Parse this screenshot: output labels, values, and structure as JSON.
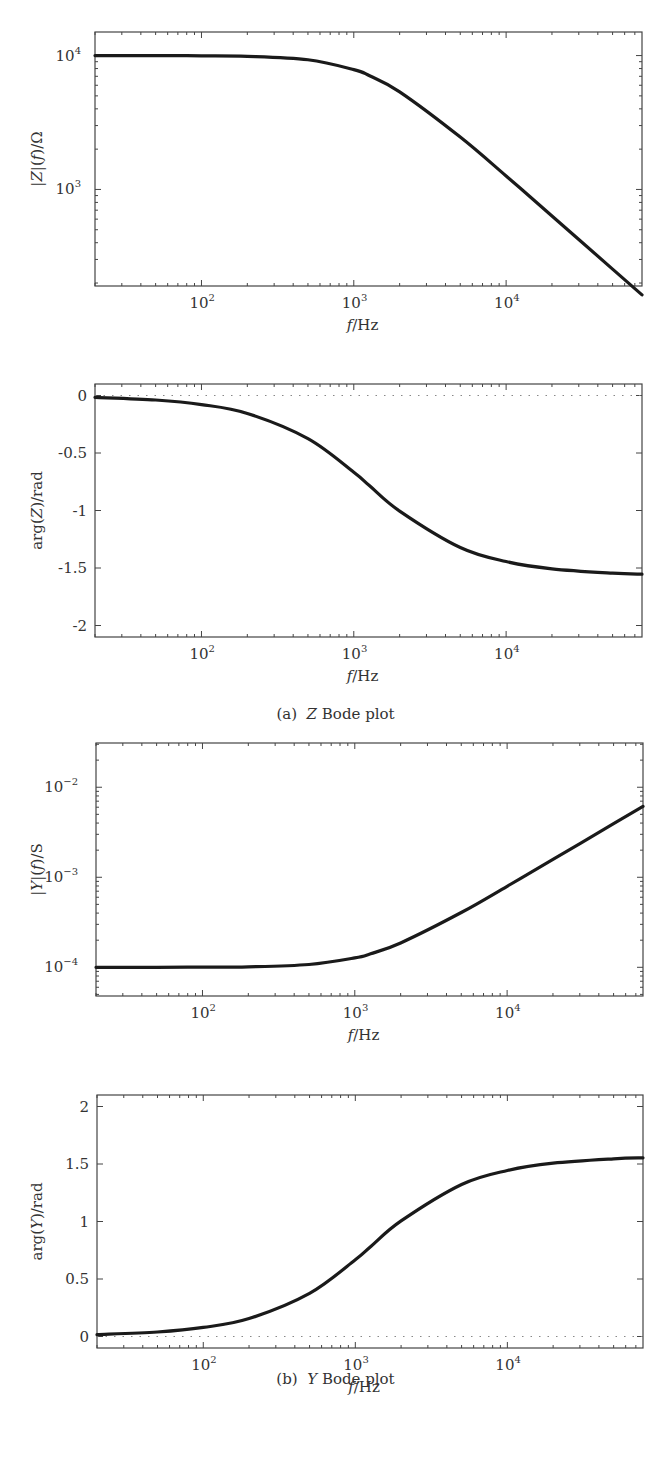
{
  "figure": {
    "captions": [
      {
        "prefix": "(a)",
        "symbol": "Z",
        "text": "Bode plot",
        "top": 705
      },
      {
        "prefix": "(b)",
        "symbol": "Y",
        "text": "Bode plot",
        "top": 1370
      }
    ]
  },
  "style": {
    "line_color": "#1a1a1a",
    "axis_color": "#444444",
    "dotted_color": "#888888"
  },
  "chart_data": [
    {
      "id": "z-magnitude",
      "type": "line",
      "title": "",
      "xlabel": "f/Hz",
      "ylabel": "|Z|(f)/Ω",
      "xscale": "log",
      "yscale": "log",
      "xlim": [
        20,
        78000
      ],
      "ylim": [
        190,
        15000
      ],
      "xticks": [
        {
          "value": 100,
          "label": "10^2"
        },
        {
          "value": 1000,
          "label": "10^3"
        },
        {
          "value": 10000,
          "label": "10^4"
        }
      ],
      "yticks": [
        {
          "value": 1000,
          "label": "10^3"
        },
        {
          "value": 10000,
          "label": "10^4"
        }
      ],
      "grid": false,
      "zero_line": false,
      "series": [
        {
          "name": "|Z|",
          "x": [
            20,
            50,
            100,
            200,
            500,
            1000,
            1270,
            2000,
            5000,
            10000,
            20000,
            50000,
            78000
          ],
          "y": [
            10000,
            9996,
            9961,
            9878,
            9305,
            7857,
            7071,
            5362,
            2462,
            1260,
            634,
            254,
            163
          ]
        }
      ],
      "box": {
        "left": 95,
        "top": 32,
        "width": 547,
        "height": 254
      }
    },
    {
      "id": "z-phase",
      "type": "line",
      "title": "",
      "xlabel": "f/Hz",
      "ylabel": "arg(Z)/rad",
      "xscale": "log",
      "yscale": "linear",
      "xlim": [
        20,
        78000
      ],
      "ylim": [
        -2.1,
        0.1
      ],
      "xticks": [
        {
          "value": 100,
          "label": "10^2"
        },
        {
          "value": 1000,
          "label": "10^3"
        },
        {
          "value": 10000,
          "label": "10^4"
        }
      ],
      "yticks": [
        {
          "value": 0,
          "label": "0"
        },
        {
          "value": -0.5,
          "label": "-0.5"
        },
        {
          "value": -1,
          "label": "-1"
        },
        {
          "value": -1.5,
          "label": "-1.5"
        },
        {
          "value": -2,
          "label": "-2"
        }
      ],
      "grid": false,
      "zero_line": true,
      "series": [
        {
          "name": "arg(Z)",
          "x": [
            20,
            50,
            100,
            200,
            500,
            1000,
            1270,
            2000,
            5000,
            10000,
            20000,
            50000,
            78000
          ],
          "y": [
            -0.016,
            -0.039,
            -0.079,
            -0.156,
            -0.375,
            -0.667,
            -0.785,
            -1.005,
            -1.322,
            -1.444,
            -1.507,
            -1.545,
            -1.554
          ]
        }
      ],
      "box": {
        "left": 95,
        "top": 384,
        "width": 547,
        "height": 253
      }
    },
    {
      "id": "y-magnitude",
      "type": "line",
      "title": "",
      "xlabel": "f/Hz",
      "ylabel": "|Y|(f)/S",
      "xscale": "log",
      "yscale": "log",
      "xlim": [
        20,
        78000
      ],
      "ylim": [
        4.8e-05,
        0.031
      ],
      "xticks": [
        {
          "value": 100,
          "label": "10^2"
        },
        {
          "value": 1000,
          "label": "10^3"
        },
        {
          "value": 10000,
          "label": "10^4"
        }
      ],
      "yticks": [
        {
          "value": 0.0001,
          "label": "10^-4"
        },
        {
          "value": 0.001,
          "label": "10^-3"
        },
        {
          "value": 0.01,
          "label": "10^-2"
        }
      ],
      "grid": false,
      "zero_line": false,
      "series": [
        {
          "name": "|Y|",
          "x": [
            20,
            50,
            100,
            200,
            500,
            1000,
            1270,
            2000,
            5000,
            10000,
            20000,
            50000,
            78000
          ],
          "y": [
            0.0001,
            0.0001,
            0.0001004,
            0.0001012,
            0.0001075,
            0.0001273,
            0.0001414,
            0.0001865,
            0.000406,
            0.000794,
            0.001578,
            0.003937,
            0.00614
          ]
        }
      ],
      "box": {
        "left": 96,
        "top": 743,
        "width": 547,
        "height": 253
      }
    },
    {
      "id": "y-phase",
      "type": "line",
      "title": "",
      "xlabel": "f/Hz",
      "ylabel": "arg(Y)/rad",
      "xscale": "log",
      "yscale": "linear",
      "xlim": [
        20,
        78000
      ],
      "ylim": [
        -0.1,
        2.1
      ],
      "xticks": [
        {
          "value": 100,
          "label": "10^2"
        },
        {
          "value": 1000,
          "label": "10^3"
        },
        {
          "value": 10000,
          "label": "10^4"
        }
      ],
      "yticks": [
        {
          "value": 0,
          "label": "0"
        },
        {
          "value": 0.5,
          "label": "0.5"
        },
        {
          "value": 1,
          "label": "1"
        },
        {
          "value": 1.5,
          "label": "1.5"
        },
        {
          "value": 2,
          "label": "2"
        }
      ],
      "grid": false,
      "zero_line": true,
      "series": [
        {
          "name": "arg(Y)",
          "x": [
            20,
            50,
            100,
            200,
            500,
            1000,
            1270,
            2000,
            5000,
            10000,
            20000,
            50000,
            78000
          ],
          "y": [
            0.016,
            0.039,
            0.079,
            0.156,
            0.375,
            0.667,
            0.785,
            1.005,
            1.322,
            1.444,
            1.507,
            1.545,
            1.554
          ]
        }
      ],
      "box": {
        "left": 97,
        "top": 1095,
        "width": 546,
        "height": 253
      }
    }
  ]
}
